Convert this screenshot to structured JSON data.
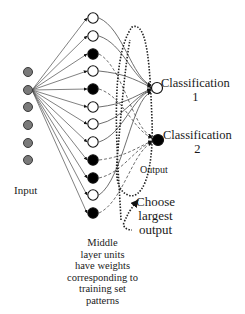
{
  "diagram": {
    "title": "",
    "colors": {
      "input_fill": "#7a7a7a",
      "input_stroke": "#3a3a3a",
      "filled_unit": "#000000",
      "hollow_unit": "#ffffff",
      "line": "#4a4a4a",
      "dotted": "#222222"
    },
    "input_layer": {
      "label": "Input",
      "x": 28,
      "nodes_y": [
        72,
        90,
        107,
        125,
        143,
        160
      ],
      "fan_source_index": 1
    },
    "middle_layer": {
      "x": 93,
      "nodes": [
        {
          "y": 18,
          "filled": false,
          "target": 0
        },
        {
          "y": 36,
          "filled": false,
          "target": 0
        },
        {
          "y": 54,
          "filled": true,
          "target": 1
        },
        {
          "y": 71,
          "filled": false,
          "target": 0
        },
        {
          "y": 89,
          "filled": true,
          "target": 1
        },
        {
          "y": 107,
          "filled": false,
          "target": 0
        },
        {
          "y": 124,
          "filled": false,
          "target": 0
        },
        {
          "y": 142,
          "filled": false,
          "target": 0
        },
        {
          "y": 160,
          "filled": true,
          "target": 1
        },
        {
          "y": 178,
          "filled": true,
          "target": 1
        },
        {
          "y": 195,
          "filled": false,
          "target": 0
        },
        {
          "y": 213,
          "filled": true,
          "target": 1
        }
      ],
      "caption_lines": [
        "Middle",
        "layer units",
        "have weights",
        "corresponding to",
        "training set",
        "patterns"
      ]
    },
    "output_layer": {
      "label": "Output",
      "nodes": [
        {
          "x": 157,
          "y": 88,
          "filled": false,
          "label_lines": [
            "Classification",
            "1"
          ]
        },
        {
          "x": 158,
          "y": 140,
          "filled": true,
          "label_lines": [
            "Classification",
            "2"
          ]
        }
      ]
    },
    "selector": {
      "label_lines": [
        "Choose",
        "largest",
        "output"
      ]
    }
  }
}
